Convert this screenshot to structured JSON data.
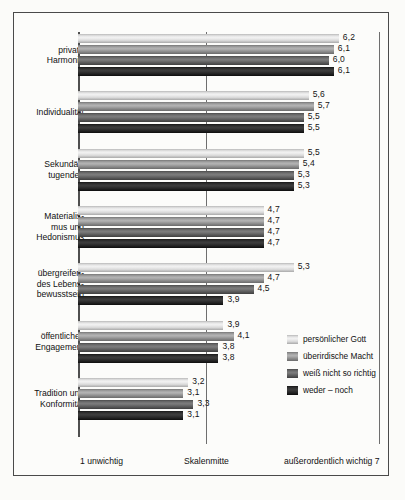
{
  "chart_data": {
    "type": "bar",
    "orientation": "horizontal",
    "title": "",
    "xlabel": "",
    "ylabel": "",
    "xlim": [
      1,
      7
    ],
    "grid": false,
    "legend_position": "right",
    "axis_captions": {
      "left": "1  unwichtig",
      "middle": "Skalenmitte",
      "right": "außerordentlich wichtig  7"
    },
    "categories": [
      "private Harmonie",
      "Individualität",
      "Sekundärtugenden",
      "Materialismus und Hedonismus",
      "übergreifendes Lebensbewusstsein",
      "öffentliches Engagement",
      "Tradition und Konformität"
    ],
    "category_lines": [
      [
        "private",
        "Harmonie"
      ],
      [
        "Individualität"
      ],
      [
        "Sekundär-",
        "tugenden"
      ],
      [
        "Materialis-",
        "mus und",
        "Hedonismus"
      ],
      [
        "übergreifen-",
        "des Lebens-",
        "bewusstsein"
      ],
      [
        "öffentliches",
        "Engagement"
      ],
      [
        "Tradition und",
        "Konformität"
      ]
    ],
    "series": [
      {
        "name": "persönlicher Gott",
        "color": "#eeeeee",
        "values": [
          6.2,
          5.6,
          5.5,
          4.7,
          5.3,
          3.9,
          3.2
        ],
        "labels": [
          "6,2",
          "5,6",
          "5,5",
          "4,7",
          "5,3",
          "3,9",
          "3,2"
        ]
      },
      {
        "name": "überirdische Macht",
        "color": "#9e9e9e",
        "values": [
          6.1,
          5.7,
          5.4,
          4.7,
          4.7,
          4.1,
          3.1
        ],
        "labels": [
          "6,1",
          "5,7",
          "5,4",
          "4,7",
          "4,7",
          "4,1",
          "3,1"
        ]
      },
      {
        "name": "weiß nicht so richtig",
        "color": "#6b6b6b",
        "values": [
          6.0,
          5.5,
          5.3,
          4.7,
          4.5,
          3.8,
          3.3
        ],
        "labels": [
          "6,0",
          "5,5",
          "5,3",
          "4,7",
          "4,5",
          "3,8",
          "3,3"
        ]
      },
      {
        "name": "weder – noch",
        "color": "#2b2b2b",
        "values": [
          6.1,
          5.5,
          5.3,
          4.7,
          3.9,
          3.8,
          3.1
        ],
        "labels": [
          "6,1",
          "5,5",
          "5,3",
          "4,7",
          "3,9",
          "3,8",
          "3,1"
        ]
      }
    ]
  },
  "legend": {
    "items": [
      {
        "label": "persönlicher Gott"
      },
      {
        "label": "überirdische Macht"
      },
      {
        "label": "weiß nicht so richtig"
      },
      {
        "label": "weder – noch"
      }
    ]
  }
}
